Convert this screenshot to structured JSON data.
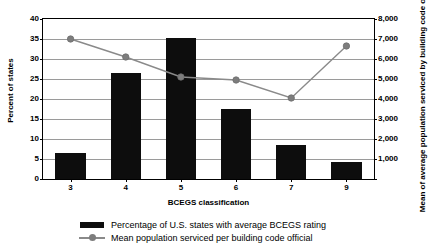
{
  "chart_data": {
    "type": "bar",
    "title": "",
    "xlabel": "BCEGS classification",
    "categories": [
      "3",
      "4",
      "5",
      "6",
      "7",
      "9"
    ],
    "grid": true,
    "legend_position": "bottom",
    "axes": {
      "left": {
        "label": "Percent of states",
        "ylim": [
          0,
          40
        ],
        "ticks": [
          "0",
          "5",
          "10",
          "15",
          "20",
          "25",
          "30",
          "35",
          "40"
        ],
        "tick_values": [
          0,
          5,
          10,
          15,
          20,
          25,
          30,
          35,
          40
        ]
      },
      "right": {
        "label": "Mean of average population serviced by building code official",
        "ylim": [
          0,
          8000
        ],
        "ticks": [
          "",
          "1,000",
          "2,000",
          "3,000",
          "4,000",
          "5,000",
          "6,000",
          "7,000",
          "8,000"
        ],
        "tick_values": [
          0,
          1000,
          2000,
          3000,
          4000,
          5000,
          6000,
          7000,
          8000
        ]
      }
    },
    "series": [
      {
        "name": "Percentage of U.S. states with average BCEGS rating",
        "type": "bar",
        "axis": "left",
        "color": "#0d0d0d",
        "values": [
          6.5,
          26.5,
          35.3,
          17.5,
          8.6,
          4.2
        ]
      },
      {
        "name": "Mean population serviced per building code official",
        "type": "line",
        "axis": "right",
        "color": "#8a8a8a",
        "marker": "circle",
        "values": [
          7000,
          6100,
          5100,
          4950,
          4050,
          6650
        ]
      }
    ]
  },
  "legend": {
    "items": [
      {
        "label": "Percentage of U.S. states with average BCEGS rating",
        "key": "bar-swatch"
      },
      {
        "label": "Mean population serviced per building code official",
        "key": "line-marker"
      }
    ]
  }
}
